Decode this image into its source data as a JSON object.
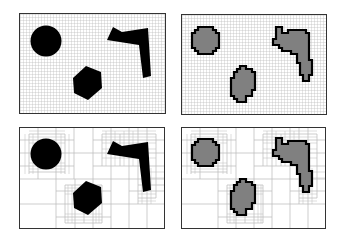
{
  "figure": {
    "colors": {
      "grid_line": "#b8b8b8",
      "frame": "#333333",
      "obstacle_solid": "#000000",
      "obstacle_fill_discretized": "#808080",
      "obstacle_outline_discretized": "#000000",
      "background": "#ffffff"
    },
    "panels": [
      {
        "id": "top-left",
        "decomposition": "uniform-grid",
        "obstacles": "continuous"
      },
      {
        "id": "top-right",
        "decomposition": "uniform-grid",
        "obstacles": "discretized"
      },
      {
        "id": "bottom-left",
        "decomposition": "quadtree",
        "obstacles": "continuous"
      },
      {
        "id": "bottom-right",
        "decomposition": "quadtree",
        "obstacles": "discretized"
      }
    ],
    "obstacles": [
      "circle",
      "hexagon",
      "l-shaped-polygon"
    ]
  }
}
